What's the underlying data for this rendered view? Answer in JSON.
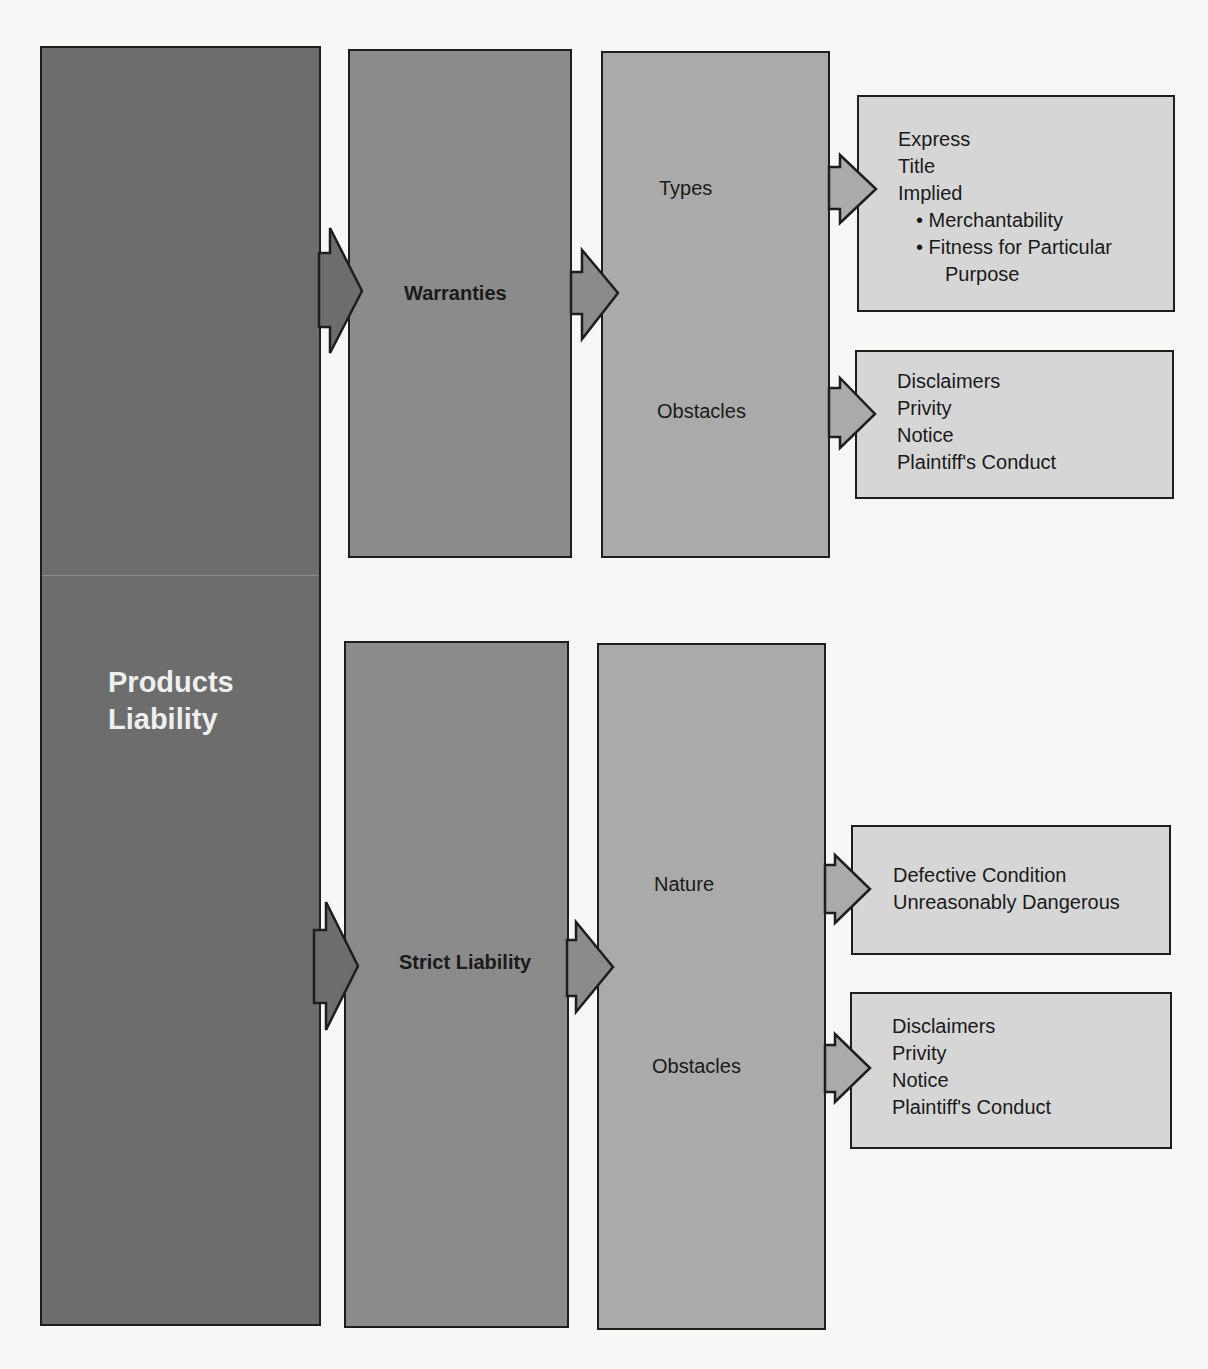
{
  "diagram": {
    "root": {
      "label_line1": "Products",
      "label_line2": "Liability"
    },
    "branches": [
      {
        "label": "Warranties",
        "aspects": [
          {
            "label": "Types",
            "items": [
              "Express",
              "Title",
              "Implied",
              "• Merchantability",
              "• Fitness for Particular",
              "Purpose"
            ]
          },
          {
            "label": "Obstacles",
            "items": [
              "Disclaimers",
              "Privity",
              "Notice",
              "Plaintiff's Conduct"
            ]
          }
        ]
      },
      {
        "label": "Strict Liability",
        "aspects": [
          {
            "label": "Nature",
            "items": [
              "Defective Condition",
              "Unreasonably Dangerous"
            ]
          },
          {
            "label": "Obstacles",
            "items": [
              "Disclaimers",
              "Privity",
              "Notice",
              "Plaintiff's Conduct"
            ]
          }
        ]
      }
    ],
    "colors": {
      "root_fill": "#6d6d6d",
      "branch_fill": "#8b8b8b",
      "aspect_fill": "#aaaaaa",
      "detail_fill": "#d6d6d6",
      "outline": "#1e1e1e",
      "background": "#f7f7f5"
    }
  }
}
